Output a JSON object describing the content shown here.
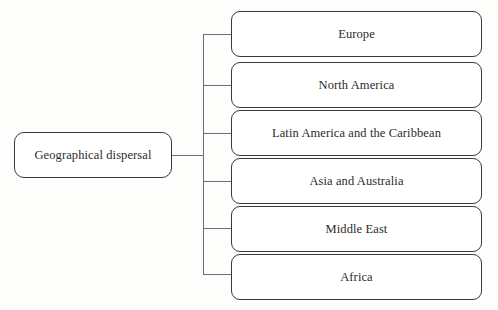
{
  "diagram": {
    "type": "tree",
    "orientation": "left-to-right",
    "root": {
      "label": "Geographical dispersal"
    },
    "children": [
      {
        "label": "Europe"
      },
      {
        "label": "North America"
      },
      {
        "label": "Latin America and the Caribbean"
      },
      {
        "label": "Asia and Australia"
      },
      {
        "label": "Middle East"
      },
      {
        "label": "Africa"
      }
    ],
    "colors": {
      "background": "#fdfdfc",
      "node_fill": "#ffffff",
      "node_border": "#3a3a3a",
      "connector": "#6d6d6d",
      "text": "#2b2b2b"
    }
  }
}
